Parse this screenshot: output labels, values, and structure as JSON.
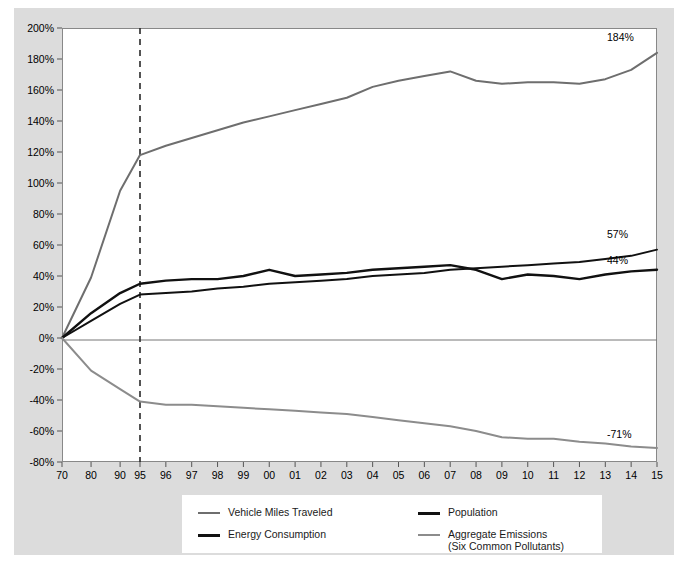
{
  "chart_data": {
    "type": "line",
    "title": "",
    "subtitle": "",
    "xlabel": "",
    "ylabel": "",
    "ylim": [
      -80,
      200
    ],
    "ytick_step": 20,
    "grid": false,
    "legend_position": "bottom",
    "y_ticks": [
      "200%",
      "180%",
      "160%",
      "140%",
      "120%",
      "100%",
      "80%",
      "60%",
      "40%",
      "20%",
      "0%",
      "-20%",
      "-40%",
      "-60%",
      "-80%"
    ],
    "categories": [
      "70",
      "80",
      "90",
      "95",
      "96",
      "97",
      "98",
      "99",
      "00",
      "01",
      "02",
      "03",
      "04",
      "05",
      "06",
      "07",
      "08",
      "09",
      "10",
      "11",
      "12",
      "13",
      "14",
      "15"
    ],
    "annotations": {
      "vertical_reference_line_at": "95",
      "vertical_reference_line_style": "dashed"
    },
    "end_labels": [
      {
        "series": "Vehicle Miles Traveled",
        "value": "184%"
      },
      {
        "series": "Population",
        "value": "57%"
      },
      {
        "series": "Energy Consumption",
        "value": "44%"
      },
      {
        "series": "Aggregate Emissions (Six Common Pollutants)",
        "value": "-71%"
      }
    ],
    "series": [
      {
        "name": "Vehicle Miles Traveled",
        "color": "#6e6e6e",
        "width": 2,
        "values": [
          0,
          39,
          95,
          118,
          124,
          129,
          134,
          139,
          143,
          147,
          151,
          155,
          162,
          166,
          169,
          172,
          166,
          164,
          165,
          165,
          164,
          167,
          173,
          184
        ]
      },
      {
        "name": "Population",
        "color": "#111111",
        "width": 2,
        "values": [
          0,
          11,
          22,
          28,
          29,
          30,
          32,
          33,
          35,
          36,
          37,
          38,
          40,
          41,
          42,
          44,
          45,
          46,
          47,
          48,
          49,
          51,
          53,
          57
        ]
      },
      {
        "name": "Energy Consumption",
        "color": "#111111",
        "width": 2.4,
        "values": [
          0,
          16,
          29,
          35,
          37,
          38,
          38,
          40,
          44,
          40,
          41,
          42,
          44,
          45,
          46,
          47,
          44,
          38,
          41,
          40,
          38,
          41,
          43,
          44
        ]
      },
      {
        "name": "Aggregate Emissions (Six Common Pollutants)",
        "color": "#8c8c8c",
        "width": 2,
        "values": [
          0,
          -21,
          -33,
          -41,
          -43,
          -43,
          -44,
          -45,
          -46,
          -47,
          -48,
          -49,
          -51,
          -53,
          -55,
          -57,
          -60,
          -64,
          -65,
          -65,
          -67,
          -68,
          -70,
          -71
        ]
      }
    ]
  },
  "legend": {
    "items": [
      {
        "label": "Vehicle Miles Traveled",
        "color": "#6e6e6e",
        "weight": "thin"
      },
      {
        "label": "Population",
        "color": "#111111",
        "weight": "thick"
      },
      {
        "label": "Energy Consumption",
        "color": "#111111",
        "weight": "thick"
      },
      {
        "label": "Aggregate Emissions",
        "label2": "(Six Common Pollutants)",
        "color": "#8c8c8c",
        "weight": "thin"
      }
    ]
  },
  "caption": {
    "text": ""
  }
}
